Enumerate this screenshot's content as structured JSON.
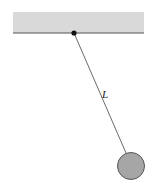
{
  "diagram": {
    "type": "simple pendulum",
    "length_label": "L",
    "colors": {
      "ceiling_fill": "#d9d9d9",
      "ceiling_edge": "#555555",
      "string": "#444444",
      "pivot": "#111111",
      "bob_fill": "#a6a6a6",
      "bob_edge": "#555555"
    }
  }
}
